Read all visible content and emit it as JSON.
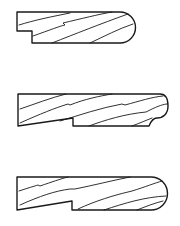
{
  "diagram": {
    "type": "molding-profile-cross-sections",
    "profiles": [
      {
        "name": "profile-1",
        "shape": "rabbeted bullnose",
        "end": "full round"
      },
      {
        "name": "profile-2",
        "shape": "rabbeted with sloped back",
        "end": "round with cove/bead"
      },
      {
        "name": "profile-3",
        "shape": "rabbeted with sloped back",
        "end": "full round"
      }
    ],
    "colors": {
      "line": "#1a1a1a",
      "background": "#ffffff"
    }
  }
}
